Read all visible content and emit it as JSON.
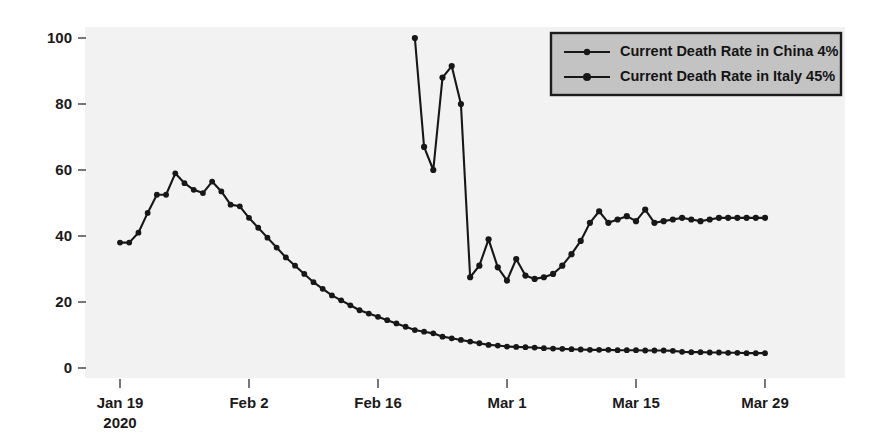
{
  "chart_data": {
    "type": "line",
    "title": "",
    "xlabel": "",
    "ylabel": "",
    "ylim": [
      0,
      105
    ],
    "grid": false,
    "legend_position": "top-right",
    "xtick_labels": [
      "Jan 19\n2020",
      "Feb 2",
      "Feb 16",
      "Mar 1",
      "Mar 15",
      "Mar 29"
    ],
    "ytick_labels": [
      "0",
      "20",
      "40",
      "60",
      "80",
      "100"
    ],
    "ytick_values": [
      0,
      20,
      40,
      60,
      80,
      100
    ],
    "x_axis_type": "date",
    "x_start": "2020-01-19",
    "x_end": "2020-03-29",
    "series": [
      {
        "name": "Current Death Rate in China 4%",
        "legend_label": "Current Death Rate in China 4%",
        "color": "#171717",
        "marker": "o",
        "start_date": "2020-01-19",
        "values": [
          38,
          38,
          41,
          47,
          52.5,
          52.5,
          59,
          56,
          54,
          53,
          56.5,
          53.5,
          49.5,
          49,
          45.5,
          42.5,
          39.5,
          36.5,
          33.5,
          31,
          28.5,
          26,
          24,
          22,
          20.5,
          19,
          17.5,
          16.5,
          15.5,
          14.5,
          13.5,
          12.5,
          11.5,
          11,
          10.5,
          9.5,
          9,
          8.5,
          8,
          7.5,
          7,
          6.8,
          6.5,
          6.4,
          6.3,
          6.2,
          6,
          5.9,
          5.8,
          5.7,
          5.6,
          5.5,
          5.5,
          5.5,
          5.4,
          5.4,
          5.4,
          5.3,
          5.3,
          5.3,
          5.2,
          4.9,
          4.8,
          4.8,
          4.7,
          4.7,
          4.6,
          4.6,
          4.5,
          4.5,
          4.5
        ]
      },
      {
        "name": "Current Death Rate in Italy 45%",
        "legend_label": "Current Death Rate in Italy 45%",
        "color": "#171717",
        "marker": "o",
        "start_date": "2020-02-20",
        "values": [
          100,
          67,
          60,
          88,
          91.5,
          80,
          27.5,
          31,
          39,
          30.5,
          26.5,
          33,
          28,
          27,
          27.5,
          28.5,
          31,
          34.5,
          38.5,
          44,
          47.5,
          44,
          45,
          46,
          44.5,
          48,
          44,
          44.5,
          45,
          45.5,
          45,
          44.5,
          45,
          45.5,
          45.5,
          45.5,
          45.5,
          45.5,
          45.5
        ]
      }
    ]
  },
  "legend": {
    "entries": [
      {
        "label": "Current Death Rate in China 4%"
      },
      {
        "label": "Current Death Rate in Italy 45%"
      }
    ]
  },
  "axes": {
    "x_ticks": [
      {
        "label_line1": "Jan 19",
        "label_line2": "2020"
      },
      {
        "label_line1": "Feb 2",
        "label_line2": ""
      },
      {
        "label_line1": "Feb 16",
        "label_line2": ""
      },
      {
        "label_line1": "Mar 1",
        "label_line2": ""
      },
      {
        "label_line1": "Mar 15",
        "label_line2": ""
      },
      {
        "label_line1": "Mar 29",
        "label_line2": ""
      }
    ],
    "y_ticks": [
      {
        "label": "100"
      },
      {
        "label": "80"
      },
      {
        "label": "60"
      },
      {
        "label": "40"
      },
      {
        "label": "20"
      },
      {
        "label": "0"
      }
    ]
  },
  "colors": {
    "series_stroke": "#171717",
    "plot_background": "#f2f2f2",
    "page_background": "#ffffff",
    "legend_fill": "#c3c3c3",
    "legend_border": "#1c1c1c",
    "tick_text": "#1a1a1a"
  }
}
